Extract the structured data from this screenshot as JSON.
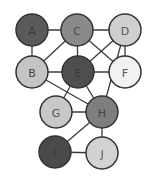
{
  "graph": {
    "nodes": [
      {
        "id": "A",
        "label": "A",
        "x": 32,
        "y": 30,
        "fill": "#5a5a5a",
        "text": "#3a3a3a"
      },
      {
        "id": "C",
        "label": "C",
        "x": 77,
        "y": 30,
        "fill": "#8a8a8a",
        "text": "#4a4a4a"
      },
      {
        "id": "D",
        "label": "D",
        "x": 125,
        "y": 30,
        "fill": "#cfcfcf",
        "text": "#555555"
      },
      {
        "id": "B",
        "label": "B",
        "x": 32,
        "y": 72,
        "fill": "#c4c4c4",
        "text": "#444444"
      },
      {
        "id": "E",
        "label": "E",
        "x": 78,
        "y": 72,
        "fill": "#4e4e4e",
        "text": "#3a3a3a"
      },
      {
        "id": "F",
        "label": "F",
        "x": 125,
        "y": 72,
        "fill": "#f2f2f2",
        "text": "#555555"
      },
      {
        "id": "G",
        "label": "G",
        "x": 56,
        "y": 112,
        "fill": "#c8c8c8",
        "text": "#555555"
      },
      {
        "id": "H",
        "label": "H",
        "x": 102,
        "y": 112,
        "fill": "#7e7e7e",
        "text": "#444444"
      },
      {
        "id": "I",
        "label": "I",
        "x": 55,
        "y": 152,
        "fill": "#4a4a4a",
        "text": "#3a3a3a"
      },
      {
        "id": "J",
        "label": "J",
        "x": 102,
        "y": 153,
        "fill": "#d2d2d2",
        "text": "#555555"
      }
    ],
    "edges": [
      [
        "A",
        "C"
      ],
      [
        "C",
        "D"
      ],
      [
        "A",
        "B"
      ],
      [
        "C",
        "E"
      ],
      [
        "C",
        "B"
      ],
      [
        "C",
        "F"
      ],
      [
        "D",
        "E"
      ],
      [
        "D",
        "F"
      ],
      [
        "D",
        "H"
      ],
      [
        "B",
        "E"
      ],
      [
        "E",
        "F"
      ],
      [
        "B",
        "H"
      ],
      [
        "E",
        "G"
      ],
      [
        "E",
        "H"
      ],
      [
        "G",
        "H"
      ],
      [
        "H",
        "I"
      ],
      [
        "H",
        "J"
      ],
      [
        "I",
        "J"
      ]
    ],
    "node_radius": 16,
    "stroke_color": "#333333",
    "edge_color": "#3a3a3a"
  }
}
